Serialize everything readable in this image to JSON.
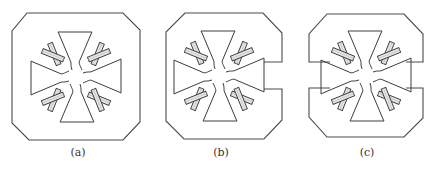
{
  "figure": {
    "panels": [
      {
        "id": "a",
        "caption": "(a)",
        "description": "Closed octagonal frame surrounding a four-armed cross with slotted fingers"
      },
      {
        "id": "b",
        "caption": "(b)",
        "description": "Octagonal frame with a single notch opening on the right side"
      },
      {
        "id": "c",
        "caption": "(c)",
        "description": "Octagonal frame split by notches on both left and right sides"
      }
    ]
  }
}
